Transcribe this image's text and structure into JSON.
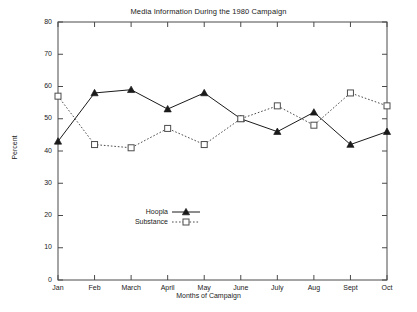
{
  "chart_data": {
    "type": "line",
    "title": "Media Information During the 1980 Campaign",
    "xlabel": "Months of Campaign",
    "ylabel": "Percent",
    "categories": [
      "Jan",
      "Feb",
      "March",
      "April",
      "May",
      "June",
      "July",
      "Aug",
      "Sept",
      "Oct"
    ],
    "series": [
      {
        "name": "Hoopla",
        "values": [
          43,
          58,
          59,
          53,
          58,
          50,
          46,
          52,
          42,
          46
        ],
        "marker": "filled-triangle",
        "linestyle": "solid",
        "color": "#1a1a1a"
      },
      {
        "name": "Substance",
        "values": [
          57,
          42,
          41,
          47,
          42,
          50,
          54,
          48,
          58,
          54
        ],
        "marker": "open-square",
        "linestyle": "dotted",
        "color": "#4d4d4d"
      }
    ],
    "ylim": [
      0,
      80
    ],
    "yticks": [
      0,
      10,
      20,
      30,
      40,
      50,
      60,
      70,
      80
    ],
    "ytick_labels": [
      "0",
      "10",
      "20",
      "30",
      "40",
      "50",
      "60",
      "70",
      "80"
    ],
    "grid": false,
    "legend_position": "inside-lower-left",
    "frame": true
  }
}
